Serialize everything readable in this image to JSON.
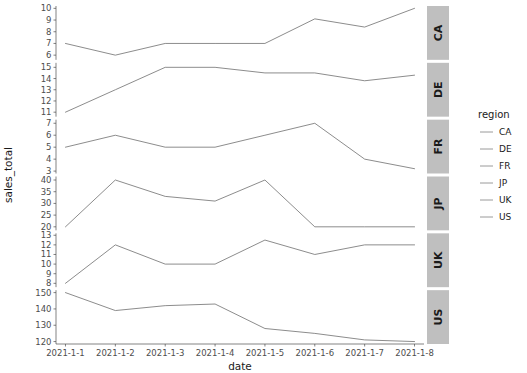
{
  "chart_data": {
    "type": "line",
    "title": "",
    "xlabel": "date",
    "ylabel": "sales_total",
    "grid": false,
    "legend_position": "right",
    "legend_title": "region",
    "facet_direction": "rows",
    "x": [
      "2021-1-1",
      "2021-1-2",
      "2021-1-3",
      "2021-1-4",
      "2021-1-5",
      "2021-1-6",
      "2021-1-7",
      "2021-1-8"
    ],
    "categories": [
      "2021-1-1",
      "2021-1-2",
      "2021-1-3",
      "2021-1-4",
      "2021-1-5",
      "2021-1-6",
      "2021-1-7",
      "2021-1-8"
    ],
    "series": [
      {
        "name": "CA",
        "strip_label": "CA",
        "values": [
          7.0,
          6.0,
          7.0,
          7.0,
          7.0,
          9.1,
          8.4,
          10.0
        ],
        "ylim": [
          5.6,
          10.2
        ],
        "yticks": [
          6,
          7,
          8,
          9,
          10
        ],
        "ytick_labels": [
          "6",
          "7",
          "8",
          "9",
          "10"
        ]
      },
      {
        "name": "DE",
        "strip_label": "DE",
        "values": [
          11.0,
          13.0,
          15.0,
          15.0,
          14.5,
          14.5,
          13.8,
          14.3
        ],
        "ylim": [
          10.6,
          15.4
        ],
        "yticks": [
          11,
          12,
          13,
          14,
          15
        ],
        "ytick_labels": [
          "11",
          "12",
          "13",
          "14",
          "15"
        ]
      },
      {
        "name": "FR",
        "strip_label": "FR",
        "values": [
          5.0,
          6.0,
          5.0,
          5.0,
          6.0,
          7.0,
          4.0,
          3.2
        ],
        "ylim": [
          2.8,
          7.3
        ],
        "yticks": [
          3,
          4,
          5,
          6,
          7
        ],
        "ytick_labels": [
          "3",
          "4",
          "5",
          "6",
          "7"
        ]
      },
      {
        "name": "JP",
        "strip_label": "JP",
        "values": [
          20.0,
          40.0,
          33.0,
          31.0,
          40.0,
          20.0,
          20.0,
          20.0
        ],
        "ylim": [
          18.5,
          41.5
        ],
        "yticks": [
          20,
          25,
          30,
          35,
          40
        ],
        "ytick_labels": [
          "20",
          "25",
          "30",
          "35",
          "40"
        ]
      },
      {
        "name": "UK",
        "strip_label": "UK",
        "values": [
          8.0,
          12.0,
          10.0,
          10.0,
          12.5,
          11.0,
          12.0,
          12.0
        ],
        "ylim": [
          7.6,
          13.2
        ],
        "yticks": [
          8,
          9,
          10,
          11,
          12,
          13
        ],
        "ytick_labels": [
          "8",
          "9",
          "10",
          "11",
          "12",
          "13"
        ]
      },
      {
        "name": "US",
        "strip_label": "US",
        "values": [
          150.0,
          139.0,
          142.0,
          143.0,
          128.0,
          125.0,
          121.0,
          120.0
        ],
        "ylim": [
          118.5,
          151.5
        ],
        "yticks": [
          120,
          130,
          140,
          150
        ],
        "ytick_labels": [
          "120",
          "130",
          "140",
          "150"
        ]
      }
    ],
    "legend_entries": [
      "CA",
      "DE",
      "FR",
      "JP",
      "UK",
      "US"
    ],
    "colors": {
      "line": "#7f7f7f",
      "strip_background": "#bfbfbf",
      "panel_background": "#ffffff",
      "axis": "#4d4d4d",
      "text": "#1a1a1a"
    }
  },
  "legend": {
    "title": "region",
    "items": [
      {
        "label": "CA"
      },
      {
        "label": "DE"
      },
      {
        "label": "FR"
      },
      {
        "label": "JP"
      },
      {
        "label": "UK"
      },
      {
        "label": "US"
      }
    ]
  },
  "axes": {
    "x_title": "date",
    "y_title": "sales_total",
    "x_tick_labels": [
      "2021-1-1",
      "2021-1-2",
      "2021-1-3",
      "2021-1-4",
      "2021-1-5",
      "2021-1-6",
      "2021-1-7",
      "2021-1-8"
    ]
  }
}
